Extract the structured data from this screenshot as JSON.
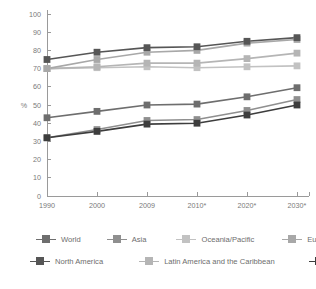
{
  "chart_data": {
    "type": "line",
    "title": "",
    "xlabel": "",
    "ylabel": "%",
    "ylim": [
      0,
      100
    ],
    "ytick_step": 10,
    "grid": false,
    "legend_position": "bottom",
    "categories": [
      "1990",
      "2000",
      "2009",
      "2010*",
      "2020*",
      "2030*"
    ],
    "yticks": [
      "0",
      "10",
      "20",
      "30",
      "40",
      "50",
      "60",
      "70",
      "80",
      "90",
      "100"
    ],
    "series": [
      {
        "name": "World",
        "color": "#6e6e6e",
        "values": [
          43,
          46.5,
          50,
          50.5,
          54.5,
          59.5
        ]
      },
      {
        "name": "Asia",
        "color": "#8f8f8f",
        "values": [
          32,
          36.5,
          41.5,
          42,
          47,
          53
        ]
      },
      {
        "name": "Oceania/Pacific",
        "color": "#c2c2c2",
        "values": [
          70,
          70.5,
          71,
          70.5,
          71,
          71.5
        ]
      },
      {
        "name": "Europe",
        "color": "#a8a8a8",
        "values": [
          70,
          75,
          79,
          80,
          84,
          86
        ]
      },
      {
        "name": "North America",
        "color": "#565656",
        "values": [
          75,
          79,
          81.5,
          82,
          85,
          87
        ]
      },
      {
        "name": "Latin America and the Caribbean",
        "color": "#b5b5b5",
        "values": [
          70,
          71,
          73,
          73,
          75.5,
          78.5
        ]
      },
      {
        "name": "Africa",
        "color": "#3d3d3d",
        "values": [
          32,
          35.5,
          39.5,
          40,
          44.5,
          50
        ]
      }
    ]
  },
  "legend": {
    "row1": [
      "World",
      "Asia",
      "Oceania/Pacific",
      "Europe"
    ],
    "row2": [
      "North America",
      "Latin America and the Caribbean",
      "Africa"
    ]
  },
  "axis": {
    "y_label": "%"
  }
}
